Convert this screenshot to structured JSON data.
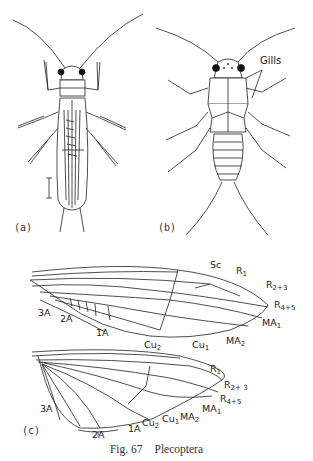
{
  "figure": {
    "caption_number": "Fig. 67",
    "caption_title": "Plecoptera",
    "panels": {
      "a": {
        "label": "(a)",
        "description": "Adult stonefly, dorsal view, wings folded, with scale bar"
      },
      "b": {
        "label": "(b)",
        "description": "Nymph, dorsal view",
        "annotation": "Gills"
      },
      "c": {
        "label": "(c)",
        "description": "Hind wing venation"
      }
    },
    "forewing_labels": {
      "sc": "Sc",
      "r1": "R",
      "r1_sub": "1",
      "r23": "R",
      "r23_sub": "2+3",
      "r45": "R",
      "r45_sub": "4+5",
      "ma1": "MA",
      "ma1_sub": "1",
      "ma2": "MA",
      "ma2_sub": "2",
      "cu1": "Cu",
      "cu1_sub": "1",
      "cu2": "Cu",
      "cu2_sub": "2",
      "a1": "1A",
      "a2": "2A",
      "a3": "3A"
    },
    "hindwing_labels": {
      "r1": "R",
      "r1_sub": "1",
      "r23": "R",
      "r23_sub": "2+ 3",
      "r45": "R",
      "r45_sub": "4+5",
      "ma1": "MA",
      "ma1_sub": "1",
      "ma2": "MA",
      "ma2_sub": "2",
      "cu1": "Cu",
      "cu1_sub": "1",
      "cu2": "Cu",
      "cu2_sub": "2",
      "a1": "1A",
      "a2": "2A",
      "a3": "3A"
    }
  }
}
